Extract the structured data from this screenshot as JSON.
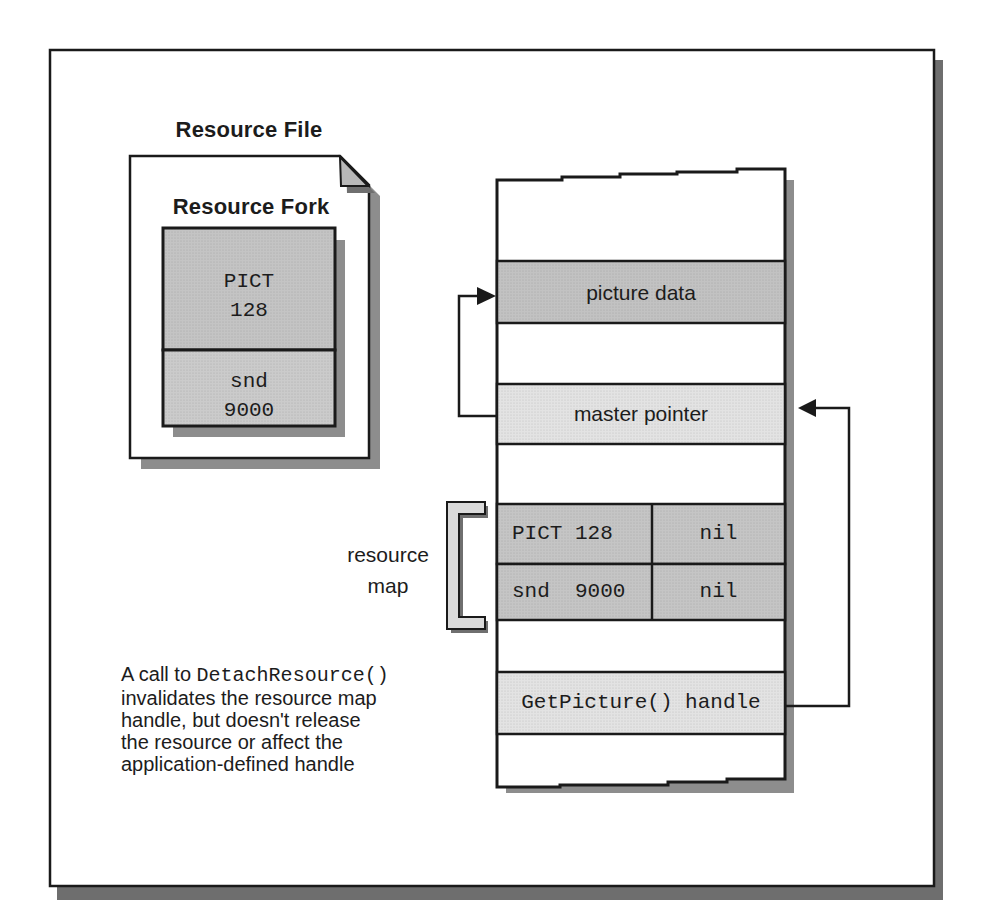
{
  "figure": {
    "resource_file": {
      "title": "Resource File",
      "fork_title": "Resource Fork",
      "resources": [
        {
          "text": "PICT\n128"
        },
        {
          "text": "snd\n9000"
        }
      ]
    },
    "memory": {
      "picture_data_label": "picture data",
      "master_pointer_label": "master pointer",
      "resource_map_label": "resource\nmap",
      "map_rows": [
        {
          "name": "PICT 128",
          "value": "nil"
        },
        {
          "name": "snd  9000",
          "value": "nil"
        }
      ],
      "handle_label": "GetPicture() handle"
    },
    "caption": {
      "prefix": "A call to ",
      "code": "DetachResource()",
      "body": "invalidates the resource map\nhandle, but doesn't release\nthe resource or affect the\napplication-defined handle"
    },
    "colors": {
      "outline": "#1a1a1a",
      "paper": "#ffffff",
      "band_dark": "#c2c2c2",
      "band_light": "#e3e3e3",
      "map_cell": "#c5c5c5",
      "pict_cell": "#c4c4c4",
      "snd_cell": "#cbcbcb",
      "fold": "#b8b8b8",
      "object_shadow": "#8d8d8d",
      "flap_shadow": "#6f6f6f",
      "frame_shadow": "#6e6e6e",
      "bracket_fill": "#dadada"
    }
  }
}
